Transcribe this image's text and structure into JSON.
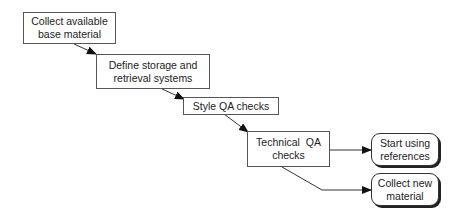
{
  "diagram": {
    "type": "flowchart",
    "nodes": [
      {
        "id": "n1",
        "label": "Collect available base material",
        "lines": [
          "Collect available",
          "base material"
        ],
        "shape": "rect"
      },
      {
        "id": "n2",
        "label": "Define storage and retrieval systems",
        "lines": [
          "Define storage and",
          "retrieval systems"
        ],
        "shape": "rect"
      },
      {
        "id": "n3",
        "label": "Style QA checks",
        "lines": [
          "Style QA checks"
        ],
        "shape": "rect"
      },
      {
        "id": "n4",
        "label": "Technical QA checks",
        "lines": [
          "Technical  QA",
          "checks"
        ],
        "shape": "rect"
      },
      {
        "id": "n5",
        "label": "Start using references",
        "lines": [
          "Start using",
          "references"
        ],
        "shape": "rounded"
      },
      {
        "id": "n6",
        "label": "Collect new material",
        "lines": [
          "Collect new",
          "material"
        ],
        "shape": "rounded"
      }
    ],
    "edges": [
      {
        "from": "n1",
        "to": "n2"
      },
      {
        "from": "n2",
        "to": "n3"
      },
      {
        "from": "n3",
        "to": "n4"
      },
      {
        "from": "n4",
        "to": "n5"
      },
      {
        "from": "n4",
        "to": "n6"
      }
    ]
  }
}
